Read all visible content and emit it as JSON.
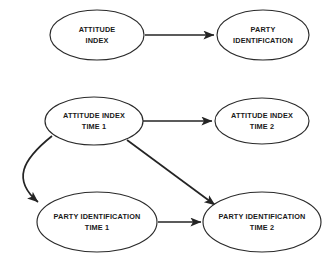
{
  "figure": {
    "kind": "path-diagram",
    "background_color": "#ffffff",
    "line_color": "#242424",
    "node_fill": "#ffffff",
    "node_stroke": "#2a2a2a",
    "caption_fragment": "",
    "nodes": [
      {
        "id": "attitude-index",
        "lines": [
          "ATTITUDE",
          "INDEX"
        ],
        "cx": 97,
        "cy": 35,
        "rx": 47,
        "ry": 25
      },
      {
        "id": "party-identification",
        "lines": [
          "PARTY",
          "IDENTIFICATION"
        ],
        "cx": 263,
        "cy": 35,
        "rx": 46,
        "ry": 25
      },
      {
        "id": "attitude-index-time-1",
        "lines": [
          "ATTITUDE INDEX",
          "TIME 1"
        ],
        "cx": 94,
        "cy": 121,
        "rx": 49,
        "ry": 24
      },
      {
        "id": "attitude-index-time-2",
        "lines": [
          "ATTITUDE INDEX",
          "TIME 2"
        ],
        "cx": 262,
        "cy": 121,
        "rx": 47,
        "ry": 23
      },
      {
        "id": "party-identification-time-1",
        "lines": [
          "PARTY IDENTIFICATION",
          "TIME 1"
        ],
        "cx": 97,
        "cy": 222,
        "rx": 60,
        "ry": 30
      },
      {
        "id": "party-identification-time-2",
        "lines": [
          "PARTY IDENTIFICATION",
          "TIME 2"
        ],
        "cx": 262,
        "cy": 222,
        "rx": 59,
        "ry": 30
      }
    ],
    "edges": [
      {
        "id": "edge-attitude-to-party",
        "from": "attitude-index",
        "to": "party-identification",
        "style": "straight",
        "d": "M 145 35 L 214 35"
      },
      {
        "id": "edge-ai1-to-ai2",
        "from": "attitude-index-time-1",
        "to": "attitude-index-time-2",
        "style": "straight",
        "d": "M 143 121 L 212 121"
      },
      {
        "id": "edge-ai1-to-pi1",
        "from": "attitude-index-time-1",
        "to": "party-identification-time-1",
        "style": "curved",
        "d": "M 52 136 C 22 160, 12 180, 38 202"
      },
      {
        "id": "edge-ai1-to-pi2",
        "from": "attitude-index-time-1",
        "to": "party-identification-time-2",
        "style": "diagonal",
        "d": "M 127 140 L 215 205"
      },
      {
        "id": "edge-pi1-to-pi2",
        "from": "party-identification-time-1",
        "to": "party-identification-time-2",
        "style": "straight",
        "d": "M 158 222 L 201 222"
      }
    ]
  }
}
